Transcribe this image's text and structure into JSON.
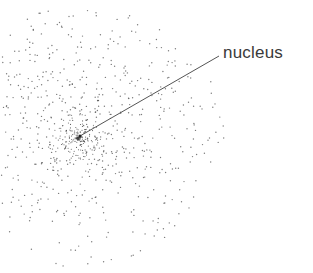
{
  "diagram": {
    "label": {
      "text": "nucleus",
      "x": 223,
      "y": 43
    },
    "leader_line": {
      "x1": 219,
      "y1": 56,
      "x2": 80,
      "y2": 136,
      "color": "#555555"
    },
    "nucleus": {
      "cx": 80,
      "cy": 136
    },
    "cloud": {
      "cx": 78,
      "cy": 138,
      "max_radius": 140,
      "dot_count": 900,
      "dot_color": "#444444",
      "seed": 7
    }
  }
}
